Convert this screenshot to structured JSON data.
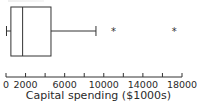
{
  "chart_data": {
    "type": "boxplot",
    "title": "",
    "xlabel": "Capital spending ($1000s)",
    "ylabel": "",
    "xlim": [
      0,
      18000
    ],
    "tick_values": [
      0,
      2000,
      4000,
      6000,
      8000,
      10000,
      12000,
      14000,
      16000,
      18000
    ],
    "tick_labels": [
      "0",
      "2000",
      "",
      "6000",
      "",
      "10000",
      "",
      "14000",
      "",
      "18000"
    ],
    "box": {
      "whisker_low": 50,
      "q1": 500,
      "median": 1700,
      "q3": 4600,
      "whisker_high": 9200
    },
    "outliers": [
      11000,
      17200
    ],
    "grid": false,
    "legend": null
  },
  "colors": {
    "line": "#333333",
    "text": "#2a2a2a",
    "background": "#ffffff"
  }
}
